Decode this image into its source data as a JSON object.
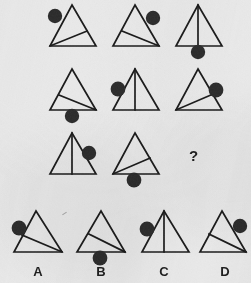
{
  "puzzle": {
    "type": "visual-analogy-matrix",
    "title_text": "",
    "question_mark": "?",
    "background_color": "#e9e9e9",
    "stroke_color": "#1a1a1a",
    "circle_fill_color": "#2b2b2b",
    "matrix": {
      "rows": 3,
      "cols": 3,
      "cells": [
        {
          "id": "cell-r1c1",
          "row": 1,
          "col": 1,
          "inner_line": "from-bottom-left-vertex-to-right-edge",
          "circle_position": "upper-left-edge",
          "missing": false
        },
        {
          "id": "cell-r1c2",
          "row": 1,
          "col": 2,
          "inner_line": "from-left-edge-to-bottom-right-vertex",
          "circle_position": "upper-right-edge",
          "missing": false
        },
        {
          "id": "cell-r1c3",
          "row": 1,
          "col": 3,
          "inner_line": "vertical-apex-to-base-center",
          "circle_position": "below-base-center",
          "missing": false
        },
        {
          "id": "cell-r2c1",
          "row": 2,
          "col": 1,
          "inner_line": "from-left-edge-to-bottom-right-vertex",
          "circle_position": "below-base-center",
          "missing": false
        },
        {
          "id": "cell-r2c2",
          "row": 2,
          "col": 2,
          "inner_line": "vertical-apex-to-base-center",
          "circle_position": "upper-left-edge",
          "missing": false
        },
        {
          "id": "cell-r2c3",
          "row": 2,
          "col": 3,
          "inner_line": "from-bottom-left-vertex-to-right-edge",
          "circle_position": "upper-right-edge",
          "missing": false
        },
        {
          "id": "cell-r3c1",
          "row": 3,
          "col": 1,
          "inner_line": "vertical-apex-to-base-center",
          "circle_position": "upper-right-edge",
          "missing": false
        },
        {
          "id": "cell-r3c2",
          "row": 3,
          "col": 2,
          "inner_line": "from-bottom-left-vertex-to-right-edge",
          "circle_position": "below-base-center",
          "missing": false
        },
        {
          "id": "cell-r3c3",
          "row": 3,
          "col": 3,
          "inner_line": "",
          "circle_position": "",
          "missing": true
        }
      ]
    },
    "options": [
      {
        "id": "option-a",
        "label": "A",
        "inner_line": "from-left-edge-to-bottom-right-vertex",
        "circle_position": "upper-left-edge"
      },
      {
        "id": "option-b",
        "label": "B",
        "inner_line": "from-left-edge-to-bottom-right-vertex",
        "circle_position": "below-base-center"
      },
      {
        "id": "option-c",
        "label": "C",
        "inner_line": "vertical-apex-to-base-center",
        "circle_position": "upper-left-edge"
      },
      {
        "id": "option-d",
        "label": "D",
        "inner_line": "from-left-edge-to-bottom-right-vertex",
        "circle_position": "upper-right-edge"
      }
    ]
  }
}
